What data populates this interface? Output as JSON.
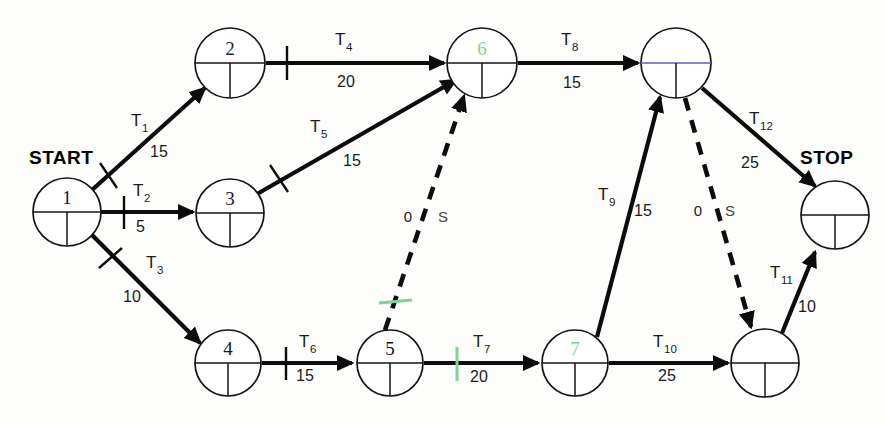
{
  "diagram": {
    "title_start": "START",
    "title_stop": "STOP",
    "nodes": [
      {
        "id": "n1",
        "label": "1",
        "cx": 67,
        "cy": 212,
        "r": 34,
        "color": "black"
      },
      {
        "id": "n2",
        "label": "2",
        "cx": 230,
        "cy": 63,
        "r": 35,
        "color": "blue"
      },
      {
        "id": "n3",
        "label": "3",
        "cx": 230,
        "cy": 213,
        "r": 34,
        "color": "black"
      },
      {
        "id": "n4",
        "label": "4",
        "cx": 228,
        "cy": 363,
        "r": 33,
        "color": "black"
      },
      {
        "id": "n5",
        "label": "5",
        "cx": 390,
        "cy": 363,
        "r": 33,
        "color": "black"
      },
      {
        "id": "n6",
        "label": "6",
        "cx": 482,
        "cy": 63,
        "r": 35,
        "color": "green"
      },
      {
        "id": "n7",
        "label": "7",
        "cx": 575,
        "cy": 363,
        "r": 33,
        "color": "green"
      },
      {
        "id": "n8",
        "label": "",
        "cx": 676,
        "cy": 63,
        "r": 35,
        "color": "blue"
      },
      {
        "id": "n9",
        "label": "",
        "cx": 765,
        "cy": 363,
        "r": 34,
        "color": "black"
      },
      {
        "id": "n10",
        "label": "",
        "cx": 835,
        "cy": 215,
        "r": 34,
        "color": "black"
      }
    ],
    "activities": [
      {
        "name": "T1",
        "sub": "1",
        "duration": "15",
        "from": "n1",
        "to": "n2",
        "style": "solid"
      },
      {
        "name": "T2",
        "sub": "2",
        "duration": "5",
        "from": "n1",
        "to": "n3",
        "style": "solid"
      },
      {
        "name": "T3",
        "sub": "3",
        "duration": "10",
        "from": "n1",
        "to": "n4",
        "style": "solid"
      },
      {
        "name": "T4",
        "sub": "4",
        "duration": "20",
        "from": "n2",
        "to": "n6",
        "style": "solid"
      },
      {
        "name": "T5",
        "sub": "5",
        "duration": "15",
        "from": "n3",
        "to": "n6",
        "style": "solid"
      },
      {
        "name": "T6",
        "sub": "6",
        "duration": "15",
        "from": "n4",
        "to": "n5",
        "style": "solid"
      },
      {
        "name": "T7",
        "sub": "7",
        "duration": "20",
        "from": "n5",
        "to": "n7",
        "style": "solid"
      },
      {
        "name": "T8",
        "sub": "8",
        "duration": "15",
        "from": "n6",
        "to": "n8",
        "style": "solid"
      },
      {
        "name": "T9",
        "sub": "9",
        "duration": "15",
        "from": "n7",
        "to": "n8",
        "style": "solid"
      },
      {
        "name": "T10",
        "sub": "10",
        "duration": "25",
        "from": "n7",
        "to": "n9",
        "style": "solid"
      },
      {
        "name": "T11",
        "sub": "11",
        "duration": "10",
        "from": "n9",
        "to": "n10",
        "style": "solid"
      },
      {
        "name": "T12",
        "sub": "12",
        "duration": "25",
        "from": "n8",
        "to": "n10",
        "style": "solid"
      }
    ],
    "dummy_activities": [
      {
        "id": "d1",
        "label": "S",
        "duration": "0",
        "from": "n5",
        "to": "n6",
        "style": "dashed"
      },
      {
        "id": "d2",
        "label": "S",
        "duration": "0",
        "from": "n8",
        "to": "n9",
        "style": "dashed"
      }
    ],
    "labels": {
      "t1": "T",
      "t1_sub": "1",
      "t1_dur": "15",
      "t2": "T",
      "t2_sub": "2",
      "t2_dur": "5",
      "t3": "T",
      "t3_sub": "3",
      "t3_dur": "10",
      "t4": "T",
      "t4_sub": "4",
      "t4_dur": "20",
      "t5": "T",
      "t5_sub": "5",
      "t5_dur": "15",
      "t6": "T",
      "t6_sub": "6",
      "t6_dur": "15",
      "t7": "T",
      "t7_sub": "7",
      "t7_dur": "20",
      "t8": "T",
      "t8_sub": "8",
      "t8_dur": "15",
      "t9": "T",
      "t9_sub": "9",
      "t9_dur": "15",
      "t10": "T",
      "t10_sub": "10",
      "t10_dur": "25",
      "t11": "T",
      "t11_sub": "11",
      "t11_dur": "10",
      "t12": "T",
      "t12_sub": "12",
      "t12_dur": "25",
      "dummy1_zero": "0",
      "dummy1_s": "S",
      "dummy2_zero": "0",
      "dummy2_s": "S"
    },
    "node_labels": {
      "n1": "1",
      "n2": "2",
      "n3": "3",
      "n4": "4",
      "n5": "5",
      "n6": "6",
      "n7": "7",
      "n8": "",
      "n9": "",
      "n10": ""
    },
    "colors": {
      "ink": "#0c0c0c",
      "green_highlight": "#7ed492",
      "blue_highlight": "#5b5bd6",
      "background": "#fdfdfc"
    }
  }
}
